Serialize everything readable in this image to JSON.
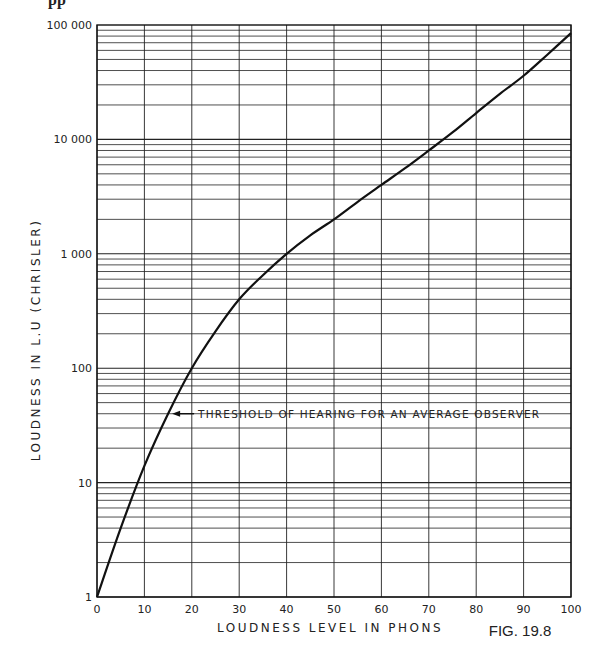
{
  "page": {
    "top_fragment": "pp",
    "figure_label": "FIG. 19.8"
  },
  "chart_data": {
    "type": "line",
    "title": "",
    "xlabel": "LOUDNESS LEVEL IN PHONS",
    "ylabel": "LOUDNESS IN L.U (CHRISLER)",
    "x_ticks": [
      "0",
      "10",
      "20",
      "30",
      "40",
      "50",
      "60",
      "70",
      "80",
      "90",
      "100"
    ],
    "y_ticks": [
      "1",
      "10",
      "100",
      "1 000",
      "10 000",
      "100 000"
    ],
    "xlim": [
      0,
      100
    ],
    "ylim": [
      1,
      100000
    ],
    "y_scale": "log",
    "grid": true,
    "legend": null,
    "series": [
      {
        "name": "Loudness vs loudness level",
        "x": [
          0,
          5,
          10,
          15,
          20,
          25,
          30,
          35,
          40,
          45,
          50,
          55,
          60,
          65,
          70,
          75,
          80,
          85,
          90,
          95,
          100
        ],
        "values": [
          1,
          4,
          14,
          40,
          100,
          210,
          400,
          650,
          1000,
          1450,
          2000,
          2850,
          4000,
          5600,
          8000,
          11500,
          17000,
          25000,
          36000,
          55000,
          85000
        ]
      }
    ],
    "annotations": [
      {
        "text": "THRESHOLD OF HEARING FOR AN AVERAGE OBSERVER",
        "arrow_to": {
          "x": 15,
          "y": 40
        }
      }
    ]
  }
}
